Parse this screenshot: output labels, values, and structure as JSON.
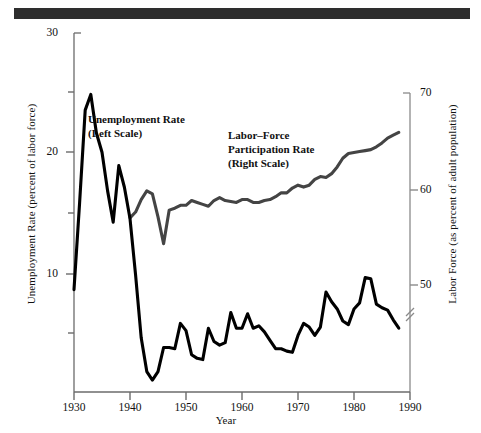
{
  "figure": {
    "background_color": "#ffffff",
    "rule_color": "#2e2e2e"
  },
  "axes": {
    "left": {
      "title": "Unemployment Rate (percent of labor force)",
      "ticks": [
        "30",
        "20",
        "10"
      ],
      "minor_ticks": [
        "25",
        "15",
        "5"
      ],
      "range": [
        0,
        30
      ]
    },
    "right": {
      "title": "Labor Force (as percent of adult population)",
      "ticks": [
        "70",
        "60",
        "50"
      ],
      "range": [
        40,
        70
      ],
      "break_mark": true
    },
    "x": {
      "title": "Year",
      "ticks": [
        "1930",
        "1940",
        "1950",
        "1960",
        "1970",
        "1980",
        "1990"
      ],
      "range": [
        1930,
        1990
      ]
    }
  },
  "annotations": {
    "unemployment": {
      "line1": "Unemployment Rate",
      "line2": "(Left Scale)"
    },
    "participation": {
      "line1": "Labor–Force",
      "line2": "Participation Rate",
      "line3": "(Right Scale)"
    }
  },
  "chart_data": {
    "type": "line",
    "title": "",
    "xlabel": "Year",
    "ylabel": "Unemployment Rate (percent of labor force)",
    "ylabel_right": "Labor Force (as percent of adult population)",
    "xlim": [
      1930,
      1990
    ],
    "ylim": [
      0,
      30
    ],
    "ylim_right": [
      40,
      70
    ],
    "grid": false,
    "legend": "inline-annotations",
    "series": [
      {
        "name": "Unemployment Rate",
        "axis": "left",
        "color": "#000000",
        "line_width": 3.1,
        "x": [
          1930,
          1931,
          1932,
          1933,
          1934,
          1935,
          1936,
          1937,
          1938,
          1939,
          1940,
          1941,
          1942,
          1943,
          1944,
          1945,
          1946,
          1947,
          1948,
          1949,
          1950,
          1951,
          1952,
          1953,
          1954,
          1955,
          1956,
          1957,
          1958,
          1959,
          1960,
          1961,
          1962,
          1963,
          1964,
          1965,
          1966,
          1967,
          1968,
          1969,
          1970,
          1971,
          1972,
          1973,
          1974,
          1975,
          1976,
          1977,
          1978,
          1979,
          1980,
          1981,
          1982,
          1983,
          1984,
          1985,
          1986,
          1987,
          1988
        ],
        "y": [
          8.7,
          15.9,
          23.6,
          24.9,
          21.7,
          20.1,
          16.9,
          14.3,
          19.0,
          17.2,
          14.6,
          9.9,
          4.7,
          1.9,
          1.2,
          1.9,
          3.9,
          3.9,
          3.8,
          5.9,
          5.3,
          3.3,
          3.0,
          2.9,
          5.5,
          4.4,
          4.1,
          4.3,
          6.8,
          5.5,
          5.5,
          6.7,
          5.5,
          5.7,
          5.2,
          4.5,
          3.8,
          3.8,
          3.6,
          3.5,
          4.9,
          5.9,
          5.6,
          4.9,
          5.6,
          8.5,
          7.7,
          7.1,
          6.1,
          5.8,
          7.1,
          7.6,
          9.7,
          9.6,
          7.5,
          7.2,
          7.0,
          6.2,
          5.5
        ]
      },
      {
        "name": "Labor-Force Participation Rate",
        "axis": "right",
        "color": "#444444",
        "line_width": 3.1,
        "x": [
          1940,
          1941,
          1942,
          1943,
          1944,
          1945,
          1946,
          1947,
          1948,
          1949,
          1950,
          1951,
          1952,
          1953,
          1954,
          1955,
          1956,
          1957,
          1958,
          1959,
          1960,
          1961,
          1962,
          1963,
          1964,
          1965,
          1966,
          1967,
          1968,
          1969,
          1970,
          1971,
          1972,
          1973,
          1974,
          1975,
          1976,
          1977,
          1978,
          1979,
          1980,
          1981,
          1982,
          1983,
          1984,
          1985,
          1986,
          1987,
          1988
        ],
        "y": [
          57.0,
          57.6,
          58.9,
          59.8,
          59.5,
          57.1,
          54.3,
          57.8,
          58.0,
          58.3,
          58.3,
          58.8,
          58.6,
          58.4,
          58.2,
          58.8,
          59.1,
          58.8,
          58.7,
          58.6,
          58.9,
          58.9,
          58.6,
          58.6,
          58.8,
          58.9,
          59.2,
          59.6,
          59.6,
          60.1,
          60.4,
          60.2,
          60.4,
          61.0,
          61.3,
          61.2,
          61.6,
          62.3,
          63.2,
          63.7,
          63.8,
          63.9,
          64.0,
          64.1,
          64.4,
          64.8,
          65.3,
          65.6,
          65.9
        ]
      }
    ]
  },
  "geometry": {
    "plot_left_px": 74,
    "plot_right_px": 410,
    "plot_top_px": 33,
    "plot_bottom_px": 392,
    "left_axis_value_top": 30,
    "left_axis_value_at_bottom": 0.2,
    "right_axis_value_top": 70,
    "right_axis_top_px": 93,
    "right_axis_value_mid": 50,
    "right_axis_mid_px": 285
  }
}
